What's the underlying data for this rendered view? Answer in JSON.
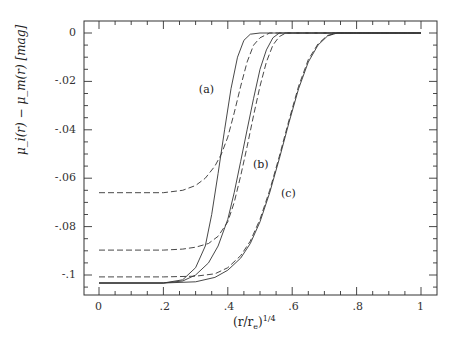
{
  "chart_data": {
    "type": "line",
    "title": "",
    "xlabel": "(r/r_e)^{1/4}",
    "xlabel_text": "(r/r",
    "xlabel_sub": "e",
    "xlabel_sup": "1/4",
    "ylabel": "μ_i(r) − μ_m(r)  [mag]",
    "xlim": [
      -0.047,
      1.05
    ],
    "ylim": [
      -0.108,
      0.005
    ],
    "xticks": [
      0,
      0.2,
      0.4,
      0.6,
      0.8,
      1
    ],
    "xtick_labels": [
      "0",
      ".2",
      ".4",
      ".6",
      ".8",
      "1"
    ],
    "yticks": [
      0,
      -0.02,
      -0.04,
      -0.06,
      -0.08,
      -0.1
    ],
    "ytick_labels": [
      "0",
      "-.02",
      "-.04",
      "-.06",
      "-.08",
      "-.1"
    ],
    "grid": false,
    "legend": null,
    "annotations": [
      {
        "text": "(a)",
        "x": 0.335,
        "y": -0.0237
      },
      {
        "text": "(b)",
        "x": 0.503,
        "y": -0.0545
      },
      {
        "text": "(c)",
        "x": 0.59,
        "y": -0.0665
      }
    ],
    "series": [
      {
        "name": "(a) solid",
        "style": "solid",
        "x": [
          0,
          0.2,
          0.26,
          0.3,
          0.33,
          0.35,
          0.37,
          0.39,
          0.41,
          0.43,
          0.45,
          0.47,
          0.5,
          0.6,
          0.8,
          1.0
        ],
        "y": [
          -0.1033,
          -0.1033,
          -0.102,
          -0.097,
          -0.088,
          -0.075,
          -0.058,
          -0.04,
          -0.023,
          -0.01,
          -0.003,
          -0.0005,
          0,
          0,
          0,
          0
        ]
      },
      {
        "name": "(a) dashed",
        "style": "dashed",
        "x": [
          0,
          0.2,
          0.26,
          0.3,
          0.33,
          0.36,
          0.38,
          0.4,
          0.42,
          0.44,
          0.46,
          0.48,
          0.5,
          0.53,
          0.6,
          0.8,
          1.0
        ],
        "y": [
          -0.066,
          -0.066,
          -0.065,
          -0.063,
          -0.06,
          -0.055,
          -0.05,
          -0.043,
          -0.033,
          -0.022,
          -0.012,
          -0.005,
          -0.002,
          0,
          0,
          0,
          0
        ]
      },
      {
        "name": "(b) solid",
        "style": "solid",
        "x": [
          0,
          0.2,
          0.26,
          0.3,
          0.34,
          0.37,
          0.4,
          0.42,
          0.44,
          0.46,
          0.48,
          0.5,
          0.52,
          0.54,
          0.56,
          0.6,
          0.8,
          1.0
        ],
        "y": [
          -0.1033,
          -0.1033,
          -0.1025,
          -0.1,
          -0.095,
          -0.088,
          -0.077,
          -0.066,
          -0.053,
          -0.04,
          -0.027,
          -0.015,
          -0.007,
          -0.002,
          0,
          0,
          0,
          0
        ]
      },
      {
        "name": "(b) dashed",
        "style": "dashed",
        "x": [
          0,
          0.2,
          0.26,
          0.3,
          0.34,
          0.37,
          0.4,
          0.42,
          0.44,
          0.46,
          0.48,
          0.5,
          0.52,
          0.54,
          0.56,
          0.58,
          0.6,
          0.8,
          1.0
        ],
        "y": [
          -0.0897,
          -0.0897,
          -0.0893,
          -0.0885,
          -0.087,
          -0.084,
          -0.078,
          -0.07,
          -0.059,
          -0.047,
          -0.034,
          -0.022,
          -0.012,
          -0.005,
          -0.0015,
          0,
          0,
          0,
          0
        ]
      },
      {
        "name": "(c) solid",
        "style": "solid",
        "x": [
          0,
          0.2,
          0.3,
          0.36,
          0.4,
          0.44,
          0.47,
          0.5,
          0.53,
          0.56,
          0.59,
          0.62,
          0.65,
          0.68,
          0.71,
          0.74,
          0.8,
          1.0
        ],
        "y": [
          -0.1033,
          -0.1033,
          -0.1028,
          -0.101,
          -0.098,
          -0.093,
          -0.087,
          -0.078,
          -0.066,
          -0.052,
          -0.037,
          -0.023,
          -0.012,
          -0.005,
          -0.0012,
          0,
          0,
          0
        ]
      },
      {
        "name": "(c) dashed",
        "style": "dashed",
        "x": [
          0,
          0.2,
          0.3,
          0.36,
          0.4,
          0.44,
          0.47,
          0.5,
          0.53,
          0.56,
          0.59,
          0.62,
          0.65,
          0.68,
          0.71,
          0.74,
          0.8,
          1.0
        ],
        "y": [
          -0.1008,
          -0.1008,
          -0.1005,
          -0.0995,
          -0.097,
          -0.092,
          -0.086,
          -0.077,
          -0.065,
          -0.051,
          -0.036,
          -0.022,
          -0.011,
          -0.0045,
          -0.001,
          0,
          0,
          0
        ]
      }
    ]
  }
}
